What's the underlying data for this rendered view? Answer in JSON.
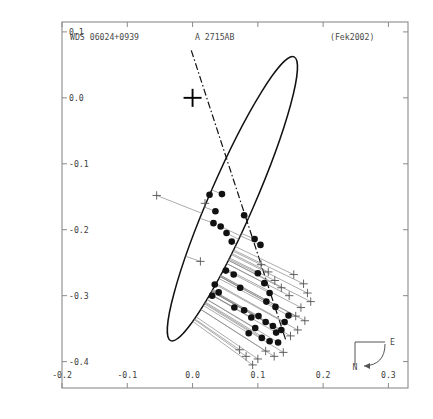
{
  "figure": {
    "kind": "binary-star-orbit-plot",
    "labels": {
      "wds_designation": "WDS 06024+0939",
      "discoverer_designation": "A 2715AB",
      "orbit_reference": "(Fek2002)"
    },
    "compass": {
      "east_label": "E",
      "north_label": "N"
    }
  },
  "chart_data": {
    "type": "scatter",
    "xlabel": "",
    "ylabel": "",
    "xlim": [
      -0.2,
      0.33
    ],
    "ylim": [
      -0.44,
      0.115
    ],
    "xticks": [
      -0.2,
      -0.1,
      0.0,
      0.1,
      0.2,
      0.3
    ],
    "xticklabels": [
      "-0.2",
      "-0.1",
      "0.0",
      "0.1",
      "0.2",
      "0.3"
    ],
    "yticks": [
      -0.4,
      -0.3,
      -0.2,
      -0.1,
      0.0,
      0.1
    ],
    "yticklabels": [
      "-0.4",
      "-0.3",
      "-0.2",
      "-0.1",
      "0.0",
      "0.1"
    ],
    "grid": false,
    "legend": null,
    "axis_units": "arcseconds",
    "primary_star": {
      "marker": "plus",
      "x": 0.0,
      "y": 0.0,
      "size": 18
    },
    "orbit_ellipse": {
      "style": "solid",
      "center_x": 0.061,
      "center_y": -0.153,
      "semi_major": 0.237,
      "semi_minor": 0.0345,
      "rotation_deg": -66.5
    },
    "line_of_nodes": {
      "style": "dashdot",
      "x1": -0.002,
      "y1": 0.072,
      "x2": 0.143,
      "y2": -0.368
    },
    "series": [
      {
        "name": "interferometric-measures",
        "marker": "filled-circle",
        "color": "#111111",
        "points": [
          {
            "x": 0.026,
            "y": -0.147
          },
          {
            "x": 0.045,
            "y": -0.146
          },
          {
            "x": 0.035,
            "y": -0.172
          },
          {
            "x": 0.032,
            "y": -0.19
          },
          {
            "x": 0.043,
            "y": -0.195
          },
          {
            "x": 0.079,
            "y": -0.178
          },
          {
            "x": 0.052,
            "y": -0.205
          },
          {
            "x": 0.06,
            "y": -0.218
          },
          {
            "x": 0.095,
            "y": -0.214
          },
          {
            "x": 0.104,
            "y": -0.223
          },
          {
            "x": 0.051,
            "y": -0.262
          },
          {
            "x": 0.063,
            "y": -0.268
          },
          {
            "x": 0.034,
            "y": -0.283
          },
          {
            "x": 0.04,
            "y": -0.295
          },
          {
            "x": 0.03,
            "y": -0.3
          },
          {
            "x": 0.073,
            "y": -0.288
          },
          {
            "x": 0.1,
            "y": -0.266
          },
          {
            "x": 0.11,
            "y": -0.281
          },
          {
            "x": 0.118,
            "y": -0.296
          },
          {
            "x": 0.064,
            "y": -0.318
          },
          {
            "x": 0.079,
            "y": -0.322
          },
          {
            "x": 0.09,
            "y": -0.333
          },
          {
            "x": 0.101,
            "y": -0.331
          },
          {
            "x": 0.112,
            "y": -0.34
          },
          {
            "x": 0.123,
            "y": -0.346
          },
          {
            "x": 0.128,
            "y": -0.356
          },
          {
            "x": 0.136,
            "y": -0.352
          },
          {
            "x": 0.106,
            "y": -0.364
          },
          {
            "x": 0.118,
            "y": -0.369
          },
          {
            "x": 0.131,
            "y": -0.371
          },
          {
            "x": 0.086,
            "y": -0.357
          },
          {
            "x": 0.096,
            "y": -0.349
          },
          {
            "x": 0.141,
            "y": -0.34
          },
          {
            "x": 0.147,
            "y": -0.33
          },
          {
            "x": 0.127,
            "y": -0.317
          },
          {
            "x": 0.113,
            "y": -0.309
          }
        ]
      },
      {
        "name": "micrometer-measures",
        "marker": "plus",
        "color": "#555555",
        "points": [
          {
            "x": -0.055,
            "y": -0.148
          },
          {
            "x": 0.019,
            "y": -0.16
          },
          {
            "x": 0.012,
            "y": -0.248
          },
          {
            "x": 0.155,
            "y": -0.268
          },
          {
            "x": 0.17,
            "y": -0.282
          },
          {
            "x": 0.176,
            "y": -0.296
          },
          {
            "x": 0.181,
            "y": -0.309
          },
          {
            "x": 0.166,
            "y": -0.318
          },
          {
            "x": 0.158,
            "y": -0.331
          },
          {
            "x": 0.172,
            "y": -0.338
          },
          {
            "x": 0.161,
            "y": -0.352
          },
          {
            "x": 0.15,
            "y": -0.361
          },
          {
            "x": 0.139,
            "y": -0.386
          },
          {
            "x": 0.125,
            "y": -0.392
          },
          {
            "x": 0.112,
            "y": -0.384
          },
          {
            "x": 0.1,
            "y": -0.396
          },
          {
            "x": 0.092,
            "y": -0.405
          },
          {
            "x": 0.082,
            "y": -0.392
          },
          {
            "x": 0.072,
            "y": -0.382
          },
          {
            "x": 0.148,
            "y": -0.3
          },
          {
            "x": 0.136,
            "y": -0.288
          },
          {
            "x": 0.126,
            "y": -0.277
          },
          {
            "x": 0.116,
            "y": -0.264
          },
          {
            "x": 0.105,
            "y": -0.253
          }
        ]
      }
    ]
  }
}
